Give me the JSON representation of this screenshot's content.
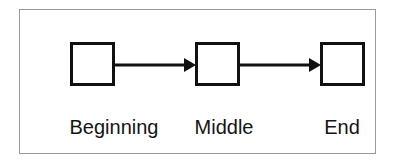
{
  "diagram": {
    "type": "linear-process-flow",
    "frame": {
      "border_color": "#9a9a9a",
      "background_color": "#ffffff"
    },
    "style": {
      "node_border_color": "#111111",
      "node_fill_color": "#ffffff",
      "connector_color": "#111111",
      "label_color": "#141414"
    },
    "nodes": [
      {
        "id": "beginning",
        "label": "Beginning",
        "shape": "square"
      },
      {
        "id": "middle",
        "label": "Middle",
        "shape": "square"
      },
      {
        "id": "end",
        "label": "End",
        "shape": "square"
      }
    ],
    "connectors": [
      {
        "id": "connector-1",
        "from": "beginning",
        "to": "middle",
        "arrow": "single-head-right"
      },
      {
        "id": "connector-2",
        "from": "middle",
        "to": "end",
        "arrow": "single-head-right"
      }
    ]
  }
}
